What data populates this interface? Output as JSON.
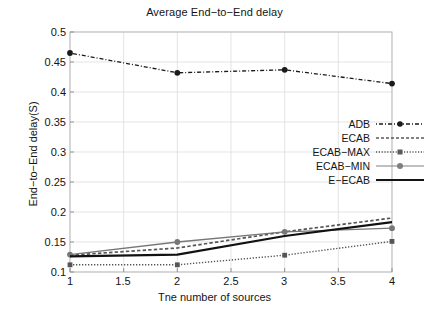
{
  "chart_data": {
    "type": "line",
    "title": "Average End−to−End delay",
    "xlabel": "Tne number of sources",
    "ylabel": "End−to−End delay(S)",
    "x": [
      1,
      2,
      3,
      4
    ],
    "xlim": [
      1,
      4
    ],
    "ylim": [
      0.1,
      0.5
    ],
    "xticks": [
      "1",
      "1.5",
      "2",
      "2.5",
      "3",
      "3.5",
      "4"
    ],
    "xtick_values": [
      1,
      1.5,
      2,
      2.5,
      3,
      3.5,
      4
    ],
    "yticks": [
      "0.1",
      "0.15",
      "0.2",
      "0.25",
      "0.3",
      "0.35",
      "0.4",
      "0.45",
      "0.5"
    ],
    "ytick_values": [
      0.1,
      0.15,
      0.2,
      0.25,
      0.3,
      0.35,
      0.4,
      0.45,
      0.5
    ],
    "grid": true,
    "legend_position": "center-right",
    "series": [
      {
        "name": "ADB",
        "values": [
          0.465,
          0.432,
          0.437,
          0.414
        ],
        "style": "dash-dot",
        "marker": "filled-circle",
        "color": "#1a1a1a"
      },
      {
        "name": "ECAB",
        "values": [
          0.128,
          0.14,
          0.167,
          0.19
        ],
        "style": "dashed",
        "marker": "none",
        "color": "#555555"
      },
      {
        "name": "ECAB−MAX",
        "values": [
          0.112,
          0.112,
          0.128,
          0.151
        ],
        "style": "dotted",
        "marker": "filled-square",
        "color": "#555555"
      },
      {
        "name": "ECAB−MIN",
        "values": [
          0.129,
          0.15,
          0.167,
          0.173
        ],
        "style": "solid-thin",
        "marker": "filled-circle",
        "color": "#777777"
      },
      {
        "name": "E−ECAB",
        "values": [
          0.126,
          0.129,
          0.16,
          0.183
        ],
        "style": "solid-bold",
        "marker": "none",
        "color": "#111111"
      }
    ]
  },
  "legend": {
    "items": [
      {
        "label": "ADB"
      },
      {
        "label": "ECAB"
      },
      {
        "label": "ECAB−MAX"
      },
      {
        "label": "ECAB−MIN"
      },
      {
        "label": "E−ECAB"
      }
    ]
  }
}
